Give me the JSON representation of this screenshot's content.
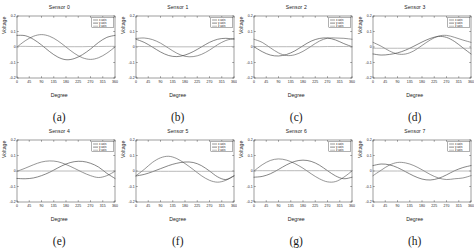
{
  "figure": {
    "caption_labels": [
      "(a)",
      "(b)",
      "(c)",
      "(d)",
      "(e)",
      "(f)",
      "(g)",
      "(h)"
    ],
    "axis": {
      "xlabel": "Degree",
      "ylabel": "Voltage"
    }
  },
  "chart_data": [
    {
      "type": "line",
      "title": "Sensor 0",
      "xlabel": "Degree",
      "ylabel": "Voltage",
      "xlim": [
        0,
        360
      ],
      "ylim": [
        -0.2,
        0.2
      ],
      "xticks": [
        0,
        45,
        90,
        135,
        180,
        225,
        270,
        315,
        360
      ],
      "yticks": [
        -0.2,
        -0.1,
        0,
        0.1,
        0.2
      ],
      "grid": false,
      "legend": [
        "x axis",
        "y axis",
        "z axis"
      ],
      "legend_position": "upper right",
      "x": [
        0,
        30,
        60,
        90,
        120,
        150,
        180,
        210,
        240,
        270,
        300,
        330,
        360
      ],
      "series": [
        {
          "name": "x axis",
          "values": [
            0.0,
            0.04,
            0.069,
            0.08,
            0.069,
            0.04,
            0.0,
            -0.04,
            -0.069,
            -0.08,
            -0.069,
            -0.04,
            0.0
          ]
        },
        {
          "name": "y axis",
          "values": [
            0.075,
            0.073,
            0.05,
            0.013,
            -0.03,
            -0.065,
            -0.082,
            -0.075,
            -0.05,
            -0.013,
            0.03,
            0.062,
            0.075
          ]
        },
        {
          "name": "z axis",
          "values": [
            0.004,
            0.004,
            0.003,
            0.003,
            0.002,
            0.002,
            0.002,
            0.002,
            0.002,
            0.003,
            0.003,
            0.004,
            0.004
          ]
        }
      ]
    },
    {
      "type": "line",
      "title": "Sensor 1",
      "xlabel": "Degree",
      "ylabel": "Voltage",
      "xlim": [
        0,
        360
      ],
      "ylim": [
        -0.2,
        0.2
      ],
      "xticks": [
        0,
        45,
        90,
        135,
        180,
        225,
        270,
        315,
        360
      ],
      "yticks": [
        -0.2,
        -0.1,
        0,
        0.1,
        0.2
      ],
      "grid": false,
      "legend": [
        "x axis",
        "y axis",
        "z axis"
      ],
      "legend_position": "upper right",
      "x": [
        0,
        30,
        60,
        90,
        120,
        150,
        180,
        210,
        240,
        270,
        300,
        330,
        360
      ],
      "series": [
        {
          "name": "x axis",
          "values": [
            0.055,
            0.058,
            0.048,
            0.025,
            -0.008,
            -0.04,
            -0.06,
            -0.062,
            -0.048,
            -0.02,
            0.015,
            0.042,
            0.055
          ]
        },
        {
          "name": "y axis",
          "values": [
            0.05,
            0.03,
            0.0,
            -0.032,
            -0.055,
            -0.062,
            -0.052,
            -0.03,
            0.0,
            0.03,
            0.05,
            0.056,
            0.05
          ]
        },
        {
          "name": "z axis",
          "values": [
            0.003,
            0.003,
            0.002,
            0.002,
            0.002,
            0.001,
            0.001,
            0.001,
            0.002,
            0.002,
            0.002,
            0.003,
            0.003
          ]
        }
      ]
    },
    {
      "type": "line",
      "title": "Sensor 2",
      "xlabel": "Degree",
      "ylabel": "Voltage",
      "xlim": [
        0,
        360
      ],
      "ylim": [
        -0.2,
        0.2
      ],
      "xticks": [
        0,
        45,
        90,
        135,
        180,
        225,
        270,
        315,
        360
      ],
      "yticks": [
        -0.2,
        -0.1,
        0,
        0.1,
        0.2
      ],
      "grid": false,
      "legend": [
        "x axis",
        "y axis",
        "z axis"
      ],
      "legend_position": "upper right",
      "x": [
        0,
        30,
        60,
        90,
        120,
        150,
        180,
        210,
        240,
        270,
        300,
        330,
        360
      ],
      "series": [
        {
          "name": "x axis",
          "values": [
            0.05,
            0.03,
            -0.005,
            -0.038,
            -0.055,
            -0.05,
            -0.028,
            0.005,
            0.038,
            0.057,
            0.058,
            0.056,
            0.05
          ]
        },
        {
          "name": "y axis",
          "values": [
            0.002,
            -0.03,
            -0.052,
            -0.058,
            -0.048,
            -0.025,
            0.008,
            0.038,
            0.055,
            0.058,
            0.045,
            0.022,
            0.002
          ]
        },
        {
          "name": "z axis",
          "values": [
            0.003,
            0.003,
            0.002,
            0.002,
            0.002,
            0.002,
            0.002,
            0.002,
            0.002,
            0.003,
            0.003,
            0.003,
            0.003
          ]
        }
      ]
    },
    {
      "type": "line",
      "title": "Sensor 3",
      "xlabel": "Degree",
      "ylabel": "Voltage",
      "xlim": [
        0,
        360
      ],
      "ylim": [
        -0.2,
        0.2
      ],
      "xticks": [
        0,
        45,
        90,
        135,
        180,
        225,
        270,
        315,
        360
      ],
      "yticks": [
        -0.2,
        -0.1,
        0,
        0.1,
        0.2
      ],
      "grid": false,
      "legend": [
        "x axis",
        "y axis",
        "z axis"
      ],
      "legend_position": "upper right",
      "x": [
        0,
        30,
        60,
        90,
        120,
        150,
        180,
        210,
        240,
        270,
        300,
        330,
        360
      ],
      "series": [
        {
          "name": "x axis",
          "values": [
            0.03,
            0.005,
            -0.025,
            -0.045,
            -0.045,
            -0.025,
            0.01,
            0.045,
            0.07,
            0.075,
            0.062,
            0.045,
            0.03
          ]
        },
        {
          "name": "y axis",
          "values": [
            -0.045,
            -0.052,
            -0.048,
            -0.038,
            -0.02,
            0.005,
            0.032,
            0.055,
            0.068,
            0.062,
            0.035,
            -0.005,
            -0.045
          ]
        },
        {
          "name": "z axis",
          "values": [
            -0.008,
            -0.008,
            -0.008,
            -0.008,
            -0.008,
            -0.008,
            -0.008,
            -0.008,
            -0.008,
            -0.008,
            -0.008,
            -0.008,
            -0.008
          ]
        }
      ]
    },
    {
      "type": "line",
      "title": "Sensor 4",
      "xlabel": "Degree",
      "ylabel": "Voltage",
      "xlim": [
        0,
        360
      ],
      "ylim": [
        -0.2,
        0.2
      ],
      "xticks": [
        0,
        45,
        90,
        135,
        180,
        225,
        270,
        315,
        360
      ],
      "yticks": [
        -0.2,
        -0.1,
        0,
        0.1,
        0.2
      ],
      "grid": false,
      "legend": [
        "x axis",
        "y axis",
        "z axis"
      ],
      "legend_position": "upper right",
      "x": [
        0,
        30,
        60,
        90,
        120,
        150,
        180,
        210,
        240,
        270,
        300,
        330,
        360
      ],
      "series": [
        {
          "name": "x axis",
          "values": [
            -0.002,
            0.018,
            0.04,
            0.058,
            0.065,
            0.06,
            0.042,
            0.018,
            -0.008,
            -0.03,
            -0.042,
            -0.03,
            -0.002
          ]
        },
        {
          "name": "y axis",
          "values": [
            -0.048,
            -0.05,
            -0.045,
            -0.03,
            -0.008,
            0.02,
            0.045,
            0.06,
            0.062,
            0.05,
            0.025,
            -0.015,
            -0.048
          ]
        },
        {
          "name": "z axis",
          "values": [
            0.0,
            0.0,
            0.0,
            0.0,
            0.0,
            0.0,
            0.0,
            0.0,
            0.0,
            0.0,
            0.0,
            0.0,
            0.0
          ]
        }
      ]
    },
    {
      "type": "line",
      "title": "Sensor 5",
      "xlabel": "Degree",
      "ylabel": "Voltage",
      "xlim": [
        0,
        360
      ],
      "ylim": [
        -0.2,
        0.2
      ],
      "xticks": [
        0,
        45,
        90,
        135,
        180,
        225,
        270,
        315,
        360
      ],
      "yticks": [
        -0.2,
        -0.1,
        0,
        0.1,
        0.2
      ],
      "grid": false,
      "legend": [
        "x axis",
        "y axis",
        "z axis"
      ],
      "legend_position": "upper right",
      "x": [
        0,
        30,
        60,
        90,
        120,
        150,
        180,
        210,
        240,
        270,
        300,
        330,
        360
      ],
      "series": [
        {
          "name": "x axis",
          "values": [
            -0.03,
            0.01,
            0.055,
            0.085,
            0.095,
            0.08,
            0.048,
            0.01,
            -0.03,
            -0.06,
            -0.072,
            -0.06,
            -0.03
          ]
        },
        {
          "name": "y axis",
          "values": [
            -0.032,
            -0.022,
            -0.005,
            0.015,
            0.035,
            0.05,
            0.058,
            0.055,
            0.035,
            0.0,
            -0.038,
            -0.055,
            -0.032
          ]
        },
        {
          "name": "z axis",
          "values": [
            -0.002,
            -0.002,
            -0.002,
            -0.002,
            -0.002,
            -0.002,
            -0.002,
            -0.002,
            -0.002,
            -0.002,
            -0.002,
            -0.002,
            -0.002
          ]
        }
      ]
    },
    {
      "type": "line",
      "title": "Sensor 6",
      "xlabel": "Degree",
      "ylabel": "Voltage",
      "xlim": [
        0,
        360
      ],
      "ylim": [
        -0.2,
        0.2
      ],
      "xticks": [
        0,
        45,
        90,
        135,
        180,
        225,
        270,
        315,
        360
      ],
      "yticks": [
        -0.2,
        -0.1,
        0,
        0.1,
        0.2
      ],
      "grid": false,
      "legend": [
        "x axis",
        "y axis",
        "z axis"
      ],
      "legend_position": "upper right",
      "x": [
        0,
        30,
        60,
        90,
        120,
        150,
        180,
        210,
        240,
        270,
        300,
        330,
        360
      ],
      "series": [
        {
          "name": "x axis",
          "values": [
            0.0,
            0.04,
            0.068,
            0.078,
            0.07,
            0.048,
            0.018,
            -0.018,
            -0.05,
            -0.07,
            -0.068,
            -0.04,
            0.0
          ]
        },
        {
          "name": "y axis",
          "values": [
            -0.04,
            -0.035,
            -0.018,
            0.01,
            0.04,
            0.062,
            0.07,
            0.062,
            0.038,
            0.002,
            -0.032,
            -0.05,
            -0.04
          ]
        },
        {
          "name": "z axis",
          "values": [
            0.002,
            0.002,
            0.002,
            0.002,
            0.002,
            0.002,
            0.002,
            0.002,
            0.002,
            0.002,
            0.002,
            0.002,
            0.002
          ]
        }
      ]
    },
    {
      "type": "line",
      "title": "Sensor 7",
      "xlabel": "Degree",
      "ylabel": "Voltage",
      "xlim": [
        0,
        360
      ],
      "ylim": [
        -0.2,
        0.2
      ],
      "xticks": [
        0,
        45,
        90,
        135,
        180,
        225,
        270,
        315,
        360
      ],
      "yticks": [
        -0.2,
        -0.1,
        0,
        0.1,
        0.2
      ],
      "grid": false,
      "legend": [
        "x axis",
        "y axis",
        "z axis"
      ],
      "legend_position": "upper right",
      "x": [
        0,
        30,
        60,
        90,
        120,
        150,
        180,
        210,
        240,
        270,
        300,
        330,
        360
      ],
      "series": [
        {
          "name": "x axis",
          "values": [
            -0.03,
            0.005,
            0.038,
            0.055,
            0.052,
            0.035,
            0.008,
            -0.022,
            -0.045,
            -0.055,
            -0.05,
            -0.045,
            -0.03
          ]
        },
        {
          "name": "y axis",
          "values": [
            0.035,
            0.045,
            0.04,
            0.022,
            -0.005,
            -0.032,
            -0.052,
            -0.058,
            -0.048,
            -0.025,
            0.002,
            0.022,
            0.035
          ]
        },
        {
          "name": "z axis",
          "values": [
            0.0,
            0.0,
            0.0,
            0.0,
            0.0,
            0.0,
            0.0,
            0.0,
            0.0,
            0.0,
            0.0,
            0.0,
            0.0
          ]
        }
      ]
    }
  ]
}
